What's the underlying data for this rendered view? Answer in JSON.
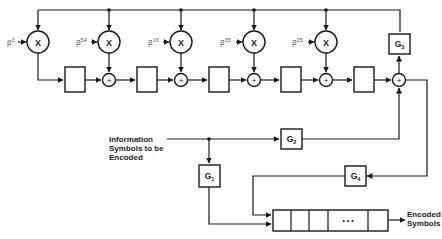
{
  "diagram": {
    "multipliers": [
      {
        "coef_base": "β",
        "coef_exp": "3",
        "symbol": "X"
      },
      {
        "coef_base": "β",
        "coef_exp": "54",
        "symbol": "X"
      },
      {
        "coef_base": "β",
        "coef_exp": "16",
        "symbol": "X"
      },
      {
        "coef_base": "β",
        "coef_exp": "35",
        "symbol": "X"
      },
      {
        "coef_base": "β",
        "coef_exp": "25",
        "symbol": "X"
      }
    ],
    "adder_symbol": "+",
    "gates": {
      "g1": {
        "base": "G",
        "sub": "1"
      },
      "g2": {
        "base": "G",
        "sub": "2"
      },
      "g3": {
        "base": "G",
        "sub": "3"
      },
      "g4": {
        "base": "G",
        "sub": "4"
      }
    },
    "input_label": [
      "Information",
      "Symbols to be",
      "Encoded"
    ],
    "output_label": [
      "Encoded",
      "Symbols"
    ],
    "output_register": {
      "ellipsis": "• • •",
      "cell_count": 5
    }
  }
}
